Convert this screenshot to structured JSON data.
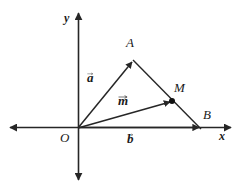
{
  "figure": {
    "background_color": "#ffffff",
    "stroke_color": "#262626",
    "text_color": "#1a1a1a"
  },
  "axes": {
    "x": {
      "label": "x",
      "origin_px": [
        78,
        128
      ],
      "left_end_px": [
        10,
        128
      ],
      "right_end_px": [
        232,
        128
      ]
    },
    "y": {
      "label": "y",
      "top_end_px": [
        78,
        12
      ],
      "bottom_end_px": [
        78,
        181
      ]
    },
    "origin_label": "O"
  },
  "points": [
    {
      "name": "O",
      "label": "O",
      "px": [
        78,
        128
      ],
      "dot": false
    },
    {
      "name": "A",
      "label": "A",
      "px": [
        133,
        60
      ],
      "dot": false
    },
    {
      "name": "B",
      "label": "B",
      "px": [
        200,
        128
      ],
      "dot": false
    },
    {
      "name": "M",
      "label": "M",
      "px": [
        172,
        101
      ],
      "dot": true
    }
  ],
  "vectors": [
    {
      "name": "a",
      "label": "a",
      "from": "O",
      "to": "A",
      "label_px": [
        88,
        72
      ]
    },
    {
      "name": "b",
      "label": "b",
      "from": "O",
      "to": "B",
      "label_px": [
        128,
        132
      ]
    },
    {
      "name": "m",
      "label": "m",
      "from": "O",
      "to": "M",
      "label_px": [
        119,
        95
      ]
    }
  ],
  "segments": [
    {
      "name": "AB",
      "from": "A",
      "to": "B",
      "arrow": false
    }
  ]
}
